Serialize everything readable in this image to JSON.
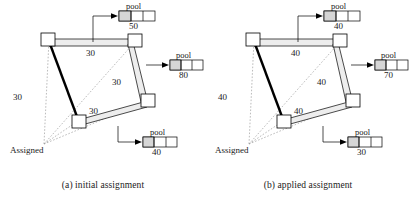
{
  "figure": {
    "panels": [
      {
        "id": "panel-a",
        "caption": "(a) initial assignment",
        "assigned_label": "Assigned",
        "edge_labels": {
          "top": "30",
          "left": "30",
          "bottom": "30",
          "right": "30"
        },
        "pools": [
          {
            "name": "pool",
            "value": "50",
            "position": "top"
          },
          {
            "name": "pool",
            "value": "80",
            "position": "right"
          },
          {
            "name": "pool",
            "value": "40",
            "position": "bottom"
          }
        ]
      },
      {
        "id": "panel-b",
        "caption": "(b) applied assignment",
        "assigned_label": "Assigned",
        "edge_labels": {
          "top": "40",
          "left": "40",
          "bottom": "40",
          "right": "40"
        },
        "pools": [
          {
            "name": "pool",
            "value": "40",
            "position": "top"
          },
          {
            "name": "pool",
            "value": "70",
            "position": "right"
          },
          {
            "name": "pool",
            "value": "30",
            "position": "bottom"
          }
        ]
      }
    ]
  },
  "style": {
    "line_color": "#000000",
    "dotted_color": "#9a9a9a",
    "pipe_fill": "#e8e8e8",
    "pool_cell_fill": "#d8d8d8",
    "background": "#ffffff"
  }
}
